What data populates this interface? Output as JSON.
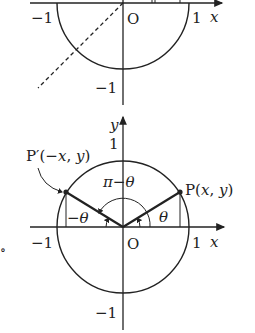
{
  "top_figure": {
    "labels": {
      "neg_one_x": "−1",
      "origin": "O",
      "one_x": "1",
      "x_axis": "x",
      "neg_one_y": "−1"
    }
  },
  "bottom_figure": {
    "labels": {
      "y_axis": "y",
      "one_y": "1",
      "p_prime": "P′(−x, y)",
      "p": "P(x, y)",
      "pi_minus_theta": "π−θ",
      "neg_theta": "−θ",
      "theta": "θ",
      "neg_one_x": "−1",
      "origin": "O",
      "one_x": "1",
      "x_axis": "x",
      "neg_one_y": "−1"
    }
  },
  "margin_mark": "∘",
  "colors": {
    "stroke": "#222222",
    "background": "#ffffff"
  }
}
